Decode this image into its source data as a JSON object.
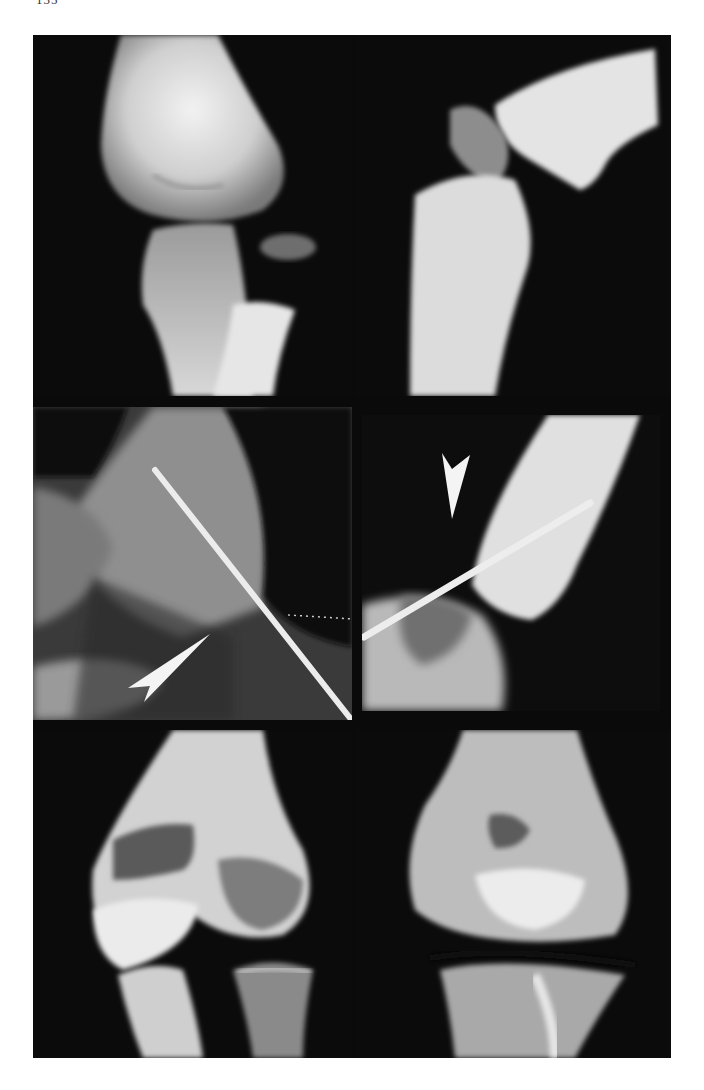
{
  "page": {
    "page_number": "135",
    "background_color": "#ffffff"
  },
  "figure": {
    "frame_color": "#0a0a0a",
    "layout": "3 rows x 2 columns radiograph montage",
    "panels": [
      {
        "id": "top-left",
        "view": "AP radiograph of elbow joint",
        "annotations": []
      },
      {
        "id": "top-right",
        "view": "lateral radiograph of elbow joint",
        "annotations": []
      },
      {
        "id": "middle-left",
        "view": "AP radiograph with fixation pin",
        "annotations": [
          "arrowhead pointing up-right"
        ]
      },
      {
        "id": "middle-right",
        "view": "lateral radiograph with fixation pin",
        "annotations": [
          "arrowhead pointing down"
        ]
      },
      {
        "id": "bottom-left",
        "view": "AP radiograph of elbow joint (follow-up)",
        "annotations": []
      },
      {
        "id": "bottom-right",
        "view": "AP radiograph of elbow joint (follow-up)",
        "annotations": []
      }
    ],
    "arrow_color": "#f4f4f4",
    "pin_color": "#e8e8e8"
  }
}
